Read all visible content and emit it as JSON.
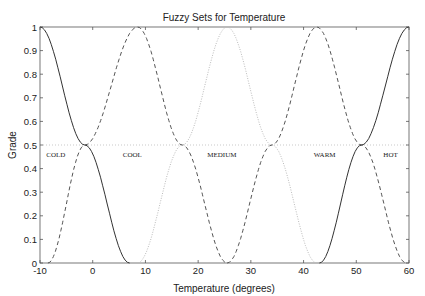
{
  "chart_data": {
    "type": "line",
    "title": "Fuzzy Sets for Temperature",
    "xlabel": "Temperature (degrees)",
    "ylabel": "Grade",
    "xlim": [
      -10,
      60
    ],
    "ylim": [
      0,
      1
    ],
    "xticks": [
      -10,
      0,
      10,
      20,
      30,
      40,
      50,
      60
    ],
    "yticks": [
      0,
      0.1,
      0.2,
      0.3,
      0.4,
      0.5,
      0.6,
      0.7,
      0.8,
      0.9,
      1
    ],
    "grid": false,
    "reference_line": {
      "y": 0.5,
      "style": "dotted"
    },
    "series": [
      {
        "name": "COLD",
        "style": "solid",
        "points": [
          [
            -10,
            1
          ],
          [
            -1.5,
            0.5
          ],
          [
            7,
            0
          ]
        ]
      },
      {
        "name": "COOL",
        "style": "dashed",
        "points": [
          [
            -8.5,
            0
          ],
          [
            -1.5,
            0.5
          ],
          [
            8.5,
            1
          ],
          [
            17,
            0.5
          ],
          [
            25.5,
            0
          ]
        ]
      },
      {
        "name": "MEDIUM",
        "style": "dotted",
        "points": [
          [
            8.5,
            0
          ],
          [
            17,
            0.5
          ],
          [
            25.5,
            1
          ],
          [
            34,
            0.5
          ],
          [
            42.5,
            0
          ]
        ]
      },
      {
        "name": "WARM",
        "style": "dashed",
        "points": [
          [
            25.5,
            0
          ],
          [
            34,
            0.5
          ],
          [
            42.5,
            1
          ],
          [
            51,
            0.5
          ],
          [
            59.5,
            0
          ]
        ]
      },
      {
        "name": "HOT",
        "style": "solid",
        "points": [
          [
            43,
            0
          ],
          [
            51,
            0.5
          ],
          [
            60,
            1
          ]
        ]
      }
    ],
    "annotations": [
      {
        "text": "COLD",
        "x": -7,
        "y": 0.46
      },
      {
        "text": "COOL",
        "x": 7.5,
        "y": 0.46
      },
      {
        "text": "MEDIUM",
        "x": 24.5,
        "y": 0.46
      },
      {
        "text": "WARM",
        "x": 44,
        "y": 0.46
      },
      {
        "text": "HOT",
        "x": 56.5,
        "y": 0.46
      }
    ]
  }
}
